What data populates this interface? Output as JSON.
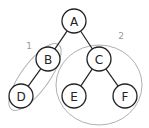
{
  "diagram": {
    "type": "binary-tree",
    "nodes": [
      {
        "id": "A",
        "label": "A"
      },
      {
        "id": "B",
        "label": "B"
      },
      {
        "id": "C",
        "label": "C"
      },
      {
        "id": "D",
        "label": "D"
      },
      {
        "id": "E",
        "label": "E"
      },
      {
        "id": "F",
        "label": "F"
      }
    ],
    "edges": [
      {
        "from": "A",
        "to": "B"
      },
      {
        "from": "A",
        "to": "C"
      },
      {
        "from": "B",
        "to": "D"
      },
      {
        "from": "C",
        "to": "E"
      },
      {
        "from": "C",
        "to": "F"
      }
    ],
    "groups": [
      {
        "id": "1",
        "label": "1",
        "members": [
          "B",
          "D"
        ]
      },
      {
        "id": "2",
        "label": "2",
        "members": [
          "C",
          "E",
          "F"
        ]
      }
    ],
    "colors": {
      "node_stroke": "#222222",
      "group_stroke": "#b0b0b0",
      "group_label": "#9a9a9a"
    }
  }
}
